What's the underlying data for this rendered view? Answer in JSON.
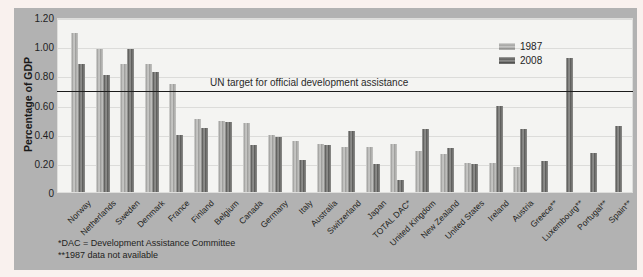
{
  "figure": {
    "ylabel": "Percentage of GDP",
    "target_label": "UN target for official development assistance",
    "footnote1": "*DAC = Development Assistance Committee",
    "footnote2": "**1987 data not available"
  },
  "colors": {
    "panel_background": "#b2b2b2",
    "plot_background": "#f4f4f2",
    "page_background": "#f9f1ee",
    "series_1987": "#b8b8b6",
    "series_2008": "#6e6e6c",
    "target_line": "#1c1c1c"
  },
  "chart_data": {
    "type": "bar",
    "title": "",
    "xlabel": "",
    "ylabel": "Percentage of GDP",
    "ylim": [
      0,
      1.2
    ],
    "ytick_labels": [
      "1.20",
      "1.00",
      "0.80",
      "0.60",
      "0.40",
      "0.20",
      "0"
    ],
    "ytick_values": [
      1.2,
      1.0,
      0.8,
      0.6,
      0.4,
      0.2,
      0
    ],
    "grid": true,
    "legend_position": "top-right",
    "target_line": {
      "value": 0.7,
      "label": "UN target for official development assistance"
    },
    "categories": [
      "Norway",
      "Netherlands",
      "Sweden",
      "Denmark",
      "France",
      "Finland",
      "Belgium",
      "Canada",
      "Germany",
      "Italy",
      "Australia",
      "Switzerland",
      "Japan",
      "TOTAL DAC*",
      "United Kingdom",
      "New Zealand",
      "United States",
      "Ireland",
      "Austria",
      "Greece**",
      "Luxembourg**",
      "Portugal**",
      "Spain**"
    ],
    "series": [
      {
        "name": "1987",
        "values": [
          1.09,
          0.98,
          0.88,
          0.88,
          0.74,
          0.5,
          0.49,
          0.47,
          0.39,
          0.35,
          0.33,
          0.31,
          0.31,
          0.33,
          0.28,
          0.26,
          0.2,
          0.2,
          0.17,
          null,
          null,
          null,
          null
        ]
      },
      {
        "name": "2008",
        "values": [
          0.88,
          0.8,
          0.98,
          0.82,
          0.39,
          0.44,
          0.48,
          0.32,
          0.38,
          0.22,
          0.32,
          0.42,
          0.19,
          0.08,
          0.43,
          0.3,
          0.19,
          0.59,
          0.43,
          0.21,
          0.92,
          0.27,
          0.45
        ]
      }
    ],
    "footnotes": [
      "*DAC = Development Assistance Committee",
      "**1987 data not available"
    ]
  }
}
